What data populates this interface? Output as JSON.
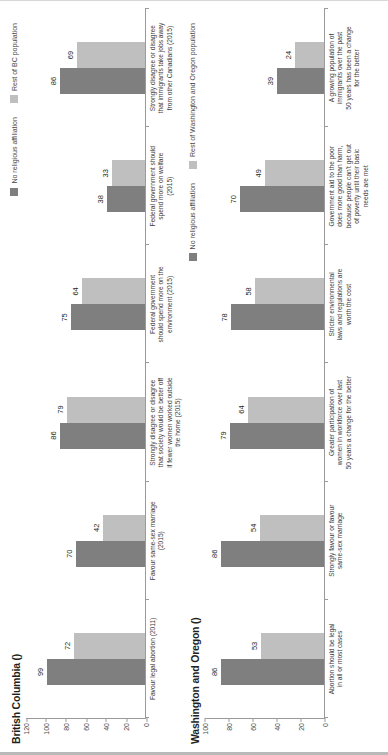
{
  "panels": [
    {
      "title": "British Columbia ()",
      "legend": [
        {
          "label": "No religious affiliation",
          "color": "#7f7f7f"
        },
        {
          "label": "Rest of BC population",
          "color": "#bfbfbf"
        }
      ],
      "chart_data": {
        "type": "bar",
        "title": "British Columbia ()",
        "xlabel": "",
        "ylabel": "",
        "ylim": [
          0,
          120
        ],
        "yticks": [
          0,
          20,
          40,
          60,
          80,
          100,
          120
        ],
        "grid": false,
        "legend_position": "top-right",
        "categories": [
          "Favour legal abortion (2011)",
          "Favour same-sex marriage\n(2015)",
          "Strongly disagree or disagree\nthat society would be better off\nif fewer women worked outside\nthe home (2015)",
          "Federal government\nshould spend more on the\nenvironment (2015)",
          "Federal government should\nspend more on welfare\n(2015)",
          "Strongly disagree or disagree\nthat immigrants take jobs away\nfrom other Canadians (2015)"
        ],
        "series": [
          {
            "name": "No religious affiliation",
            "color": "#7f7f7f",
            "values": [
              99,
              70,
              86,
              75,
              38,
              86
            ]
          },
          {
            "name": "Rest of BC population",
            "color": "#bfbfbf",
            "values": [
              72,
              42,
              79,
              64,
              33,
              69
            ]
          }
        ]
      }
    },
    {
      "title": "Washington and Oregon ()",
      "legend": [
        {
          "label": "No religious affiliation",
          "color": "#7f7f7f"
        },
        {
          "label": "Rest of Washington and Oregon population",
          "color": "#bfbfbf"
        }
      ],
      "chart_data": {
        "type": "bar",
        "title": "Washington and Oregon ()",
        "xlabel": "",
        "ylabel": "",
        "ylim": [
          0,
          100
        ],
        "yticks": [
          0,
          20,
          40,
          60,
          80,
          100
        ],
        "grid": false,
        "legend_position": "top-right",
        "categories": [
          "Abortion should be legal\nin all or most cases",
          "Strongly favour or favour\nsame-sex marriage",
          "Greater participation of\nwomen in workforce over last\n50 years a change for the better",
          "Stricter environmental\nlaws and regulations are\nworth the cost",
          "Government aid to the poor\ndoes more good than harm,\nbecause people can't get out\nof poverty until their basic\nneeds are met",
          "A growing population of\nimmigrants over the past\n50 years has been a change\nfor the better"
        ],
        "series": [
          {
            "name": "No religious affiliation",
            "color": "#7f7f7f",
            "values": [
              86,
              86,
              79,
              78,
              70,
              39
            ]
          },
          {
            "name": "Rest of Washington and Oregon population",
            "color": "#bfbfbf",
            "values": [
              53,
              54,
              64,
              58,
              49,
              24
            ]
          }
        ]
      }
    }
  ]
}
